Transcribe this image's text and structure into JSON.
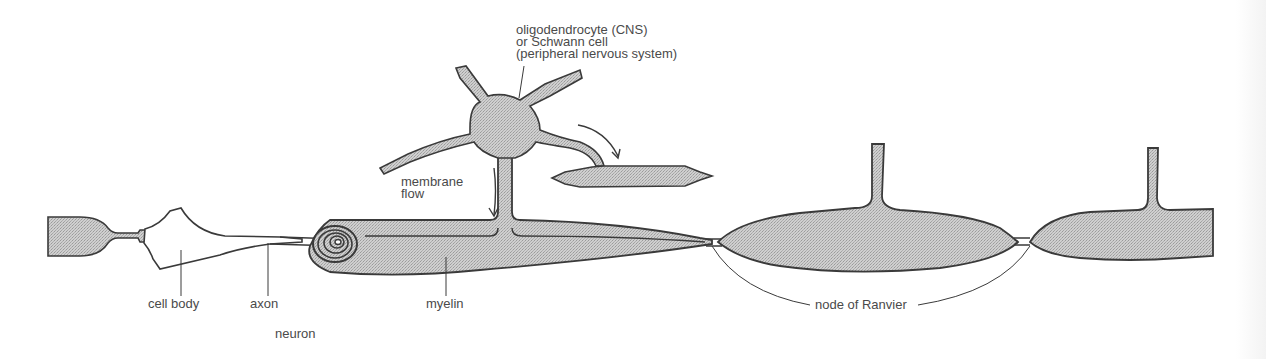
{
  "diagram": {
    "colors": {
      "fill": "#c8c8c8",
      "stroke": "#3a3a3a",
      "text": "#4a4a4a",
      "background": "#ffffff"
    },
    "labels": {
      "glia_line1": "oligodendrocyte (CNS)",
      "glia_line2": "or Schwann cell",
      "glia_line3": "(peripheral nervous system)",
      "membrane_line1": "membrane",
      "membrane_line2": "flow",
      "cell_body": "cell body",
      "axon": "axon",
      "neuron": "neuron",
      "myelin": "myelin",
      "node": "node of Ranvier"
    },
    "components": [
      "neuron-cell-body",
      "axon",
      "myelin-sheath-spiral",
      "oligodendrocyte",
      "membrane-flow-arrow",
      "myelin-segment-1",
      "myelin-segment-2",
      "node-of-ranvier-1",
      "node-of-ranvier-2"
    ]
  }
}
